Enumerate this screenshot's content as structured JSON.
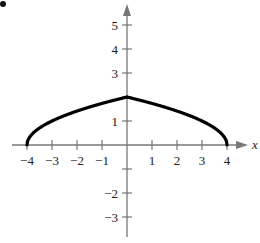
{
  "chart_data": {
    "type": "line",
    "title": "",
    "xlabel": "x",
    "ylabel": "",
    "xlim": [
      -4.5,
      4.6
    ],
    "ylim": [
      -3.6,
      5.6
    ],
    "x_ticks": [
      -4,
      -3,
      -2,
      -1,
      1,
      2,
      3,
      4
    ],
    "y_ticks": [
      -3,
      -2,
      -1,
      1,
      2,
      3,
      4,
      5
    ],
    "x_tick_labels": [
      "−4",
      "−3",
      "−2",
      "−1",
      "1",
      "2",
      "3",
      "4"
    ],
    "y_tick_labels": [
      "−3",
      "−2",
      "",
      "1",
      "",
      "3",
      "4",
      "5"
    ],
    "grid": false,
    "legend": null,
    "series": [
      {
        "name": "y = sqrt(4 - |x|)",
        "x": [
          -4,
          -3.9,
          -3.75,
          -3.5,
          -3,
          -2.5,
          -2,
          -1.5,
          -1,
          -0.5,
          0,
          0.5,
          1,
          1.5,
          2,
          2.5,
          3,
          3.5,
          3.75,
          3.9,
          4
        ],
        "y": [
          0,
          0.32,
          0.5,
          0.71,
          1.0,
          1.22,
          1.41,
          1.58,
          1.73,
          1.87,
          2.0,
          1.87,
          1.73,
          1.58,
          1.41,
          1.22,
          1.0,
          0.71,
          0.5,
          0.32,
          0
        ]
      }
    ],
    "annotations": [
      "bullet marker at top-left corner"
    ]
  },
  "labels": {
    "x_axis_name": "x"
  }
}
